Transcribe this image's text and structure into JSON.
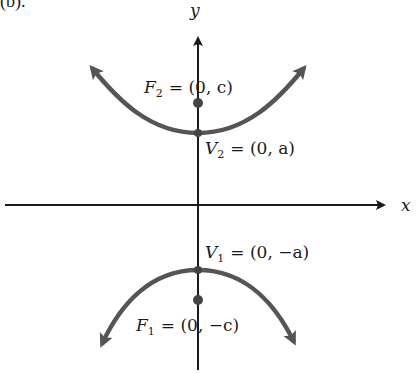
{
  "figure": {
    "caption_fragment": "(b).",
    "axes": {
      "x_label": "x",
      "y_label": "y"
    },
    "curve": {
      "type": "hyperbola",
      "orientation": "vertical",
      "color": "#555555"
    },
    "points": [
      {
        "id": "F2",
        "name": "F",
        "subscript": "2",
        "coords": "= (0, c)",
        "role": "focus"
      },
      {
        "id": "V2",
        "name": "V",
        "subscript": "2",
        "coords": "= (0, a)",
        "role": "vertex"
      },
      {
        "id": "V1",
        "name": "V",
        "subscript": "1",
        "coords": "= (0, −a)",
        "role": "vertex"
      },
      {
        "id": "F1",
        "name": "F",
        "subscript": "1",
        "coords": "= (0, −c)",
        "role": "focus"
      }
    ]
  }
}
